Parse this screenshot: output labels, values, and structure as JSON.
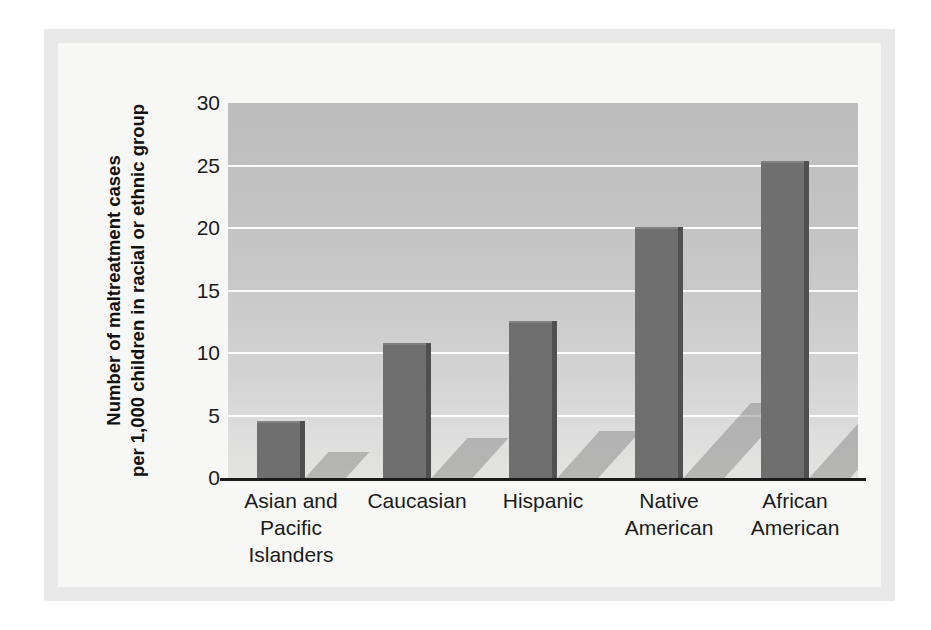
{
  "chart_data": {
    "type": "bar",
    "title": "",
    "xlabel": "",
    "ylabel": "Number of maltreatment cases per 1,000 children in racial or ethnic group",
    "ylabel_line1": "Number of maltreatment cases",
    "ylabel_line2": "per 1,000 children in racial or ethnic group",
    "categories": [
      "Asian and\nPacific\nIslanders",
      "Caucasian",
      "Hispanic",
      "Native\nAmerican",
      "African\nAmerican"
    ],
    "categories_flat": [
      "Asian and Pacific Islanders",
      "Caucasian",
      "Hispanic",
      "Native American",
      "African American"
    ],
    "values": [
      4.6,
      10.8,
      12.6,
      20.1,
      25.4
    ],
    "ylim": [
      0,
      30
    ],
    "ytick_labels": [
      "30",
      "25",
      "20",
      "15",
      "10",
      "5",
      "0"
    ],
    "ytick_values": [
      30,
      25,
      20,
      15,
      10,
      5,
      0
    ],
    "grid": true,
    "grid_color": "#fdfdfb",
    "legend": null,
    "bar_color": "#6f6f6f",
    "bar_side_color": "#505050",
    "plot_bg_top_color": "#bdbdbd",
    "plot_bg_bottom_color": "#e3e3e1",
    "page_bg_color": "#f7f7f5",
    "frame_color": "#e8e8e8",
    "axis_color": "#1b1b1b"
  }
}
